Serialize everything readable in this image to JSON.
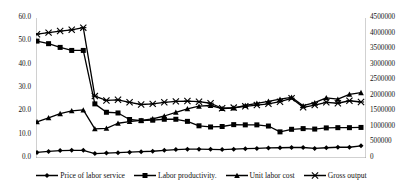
{
  "chart_data": {
    "type": "line",
    "title": "",
    "xlabel": "",
    "ylabel": "",
    "y2label": "",
    "grid": false,
    "legend_position": "bottom",
    "x": [
      1,
      2,
      3,
      4,
      5,
      6,
      7,
      8,
      9,
      10,
      11,
      12,
      13,
      14,
      15,
      16,
      17,
      18,
      19,
      20,
      21,
      22,
      23,
      24,
      25,
      26,
      27,
      28,
      29
    ],
    "ylim": [
      0,
      60
    ],
    "yticks": [
      "0.0",
      "10.0",
      "20.0",
      "30.0",
      "40.0",
      "50.0",
      "60.0"
    ],
    "y2lim": [
      0,
      4500000
    ],
    "y2ticks": [
      "0",
      "500000",
      "1000000",
      "1500000",
      "2000000",
      "2500000",
      "3000000",
      "3500000",
      "4000000",
      "4500000"
    ],
    "series": [
      {
        "name": "Price of labor service",
        "marker": "diamond",
        "axis": "left",
        "values": [
          2.4,
          2.8,
          3.2,
          3.3,
          3.3,
          1.9,
          2.1,
          2.3,
          2.5,
          2.7,
          2.9,
          3.3,
          3.6,
          3.8,
          3.8,
          3.7,
          3.6,
          3.8,
          4.0,
          4.1,
          4.3,
          4.4,
          4.5,
          4.5,
          4.1,
          4.4,
          4.6,
          4.6,
          5.2
        ]
      },
      {
        "name": "Labor productivity.",
        "marker": "square",
        "axis": "left",
        "values": [
          50.1,
          49.0,
          47.4,
          46.1,
          46.1,
          23.2,
          19.6,
          19.3,
          16.5,
          16.0,
          16.2,
          16.6,
          16.6,
          15.7,
          13.8,
          13.3,
          13.5,
          14.3,
          14.2,
          14.2,
          13.7,
          11.2,
          12.3,
          12.6,
          12.4,
          12.9,
          13.0,
          13.0,
          13.1
        ]
      },
      {
        "name": "Unit labor cost",
        "marker": "triangle",
        "axis": "left",
        "values": [
          15.5,
          17.2,
          19.0,
          20.2,
          20.6,
          12.5,
          12.7,
          14.9,
          15.6,
          16.1,
          16.8,
          18.0,
          19.6,
          21.1,
          22.2,
          22.5,
          21.2,
          21.4,
          22.5,
          23.4,
          24.3,
          25.2,
          26.0,
          22.4,
          23.7,
          25.8,
          25.2,
          27.3,
          28.0
        ]
      },
      {
        "name": "Gross  output",
        "marker": "cross",
        "axis": "right",
        "values": [
          3980000,
          4030000,
          4080000,
          4120000,
          4190000,
          1990000,
          1850000,
          1870000,
          1790000,
          1720000,
          1740000,
          1790000,
          1820000,
          1830000,
          1810000,
          1760000,
          1600000,
          1620000,
          1660000,
          1700000,
          1740000,
          1810000,
          1920000,
          1630000,
          1700000,
          1790000,
          1760000,
          1840000,
          1800000
        ]
      }
    ]
  },
  "legend": {
    "items": [
      {
        "label": "Price of labor service",
        "marker": "diamond-marker"
      },
      {
        "label": "Labor productivity.",
        "marker": "square-marker"
      },
      {
        "label": "Unit labor cost",
        "marker": "triangle-marker"
      },
      {
        "label": "Gross  output",
        "marker": "cross-marker"
      }
    ]
  },
  "colors": {
    "series": "#000000",
    "axis": "#8a8a8a",
    "text": "#111111",
    "background": "#ffffff"
  }
}
